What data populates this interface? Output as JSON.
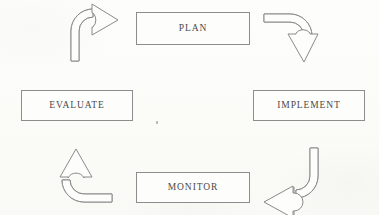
{
  "diagram": {
    "type": "cycle",
    "direction": "clockwise",
    "background_color": "#fcfcfa",
    "line_color": "#8a8a8a",
    "text_color": "#4a4a4a",
    "nodes": [
      {
        "id": "plan",
        "label": "PLAN",
        "position": "top"
      },
      {
        "id": "implement",
        "label": "IMPLEMENT",
        "position": "right"
      },
      {
        "id": "monitor",
        "label": "MONITOR",
        "position": "bottom"
      },
      {
        "id": "evaluate",
        "label": "EVALUATE",
        "position": "left"
      }
    ],
    "arrows": [
      {
        "id": "evaluate-to-plan",
        "from": "EVALUATE",
        "to": "PLAN",
        "corner": "top-left",
        "points": "right"
      },
      {
        "id": "plan-to-implement",
        "from": "PLAN",
        "to": "IMPLEMENT",
        "corner": "top-right",
        "points": "down"
      },
      {
        "id": "implement-to-monitor",
        "from": "IMPLEMENT",
        "to": "MONITOR",
        "corner": "bottom-right",
        "points": "left"
      },
      {
        "id": "monitor-to-evaluate",
        "from": "MONITOR",
        "to": "EVALUATE",
        "corner": "bottom-left",
        "points": "up"
      }
    ]
  }
}
